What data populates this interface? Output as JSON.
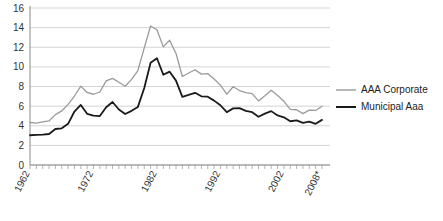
{
  "chart_data": {
    "type": "line",
    "title": "",
    "subtitle": "",
    "xlabel": "",
    "ylabel": "",
    "xlim": [
      1962,
      2008
    ],
    "ylim": [
      0,
      16
    ],
    "ytick_step": 2,
    "grid": true,
    "grid_axis": "y",
    "legend_position": "right",
    "x": [
      1962,
      1963,
      1964,
      1965,
      1966,
      1967,
      1968,
      1969,
      1970,
      1971,
      1972,
      1973,
      1974,
      1975,
      1976,
      1977,
      1978,
      1979,
      1980,
      1981,
      1982,
      1983,
      1984,
      1985,
      1986,
      1987,
      1988,
      1989,
      1990,
      1991,
      1992,
      1993,
      1994,
      1995,
      1996,
      1997,
      1998,
      1999,
      2000,
      2001,
      2002,
      2003,
      2004,
      2005,
      2006,
      2007,
      2008
    ],
    "categories": [
      "1962",
      "1963",
      "1964",
      "1965",
      "1966",
      "1967",
      "1968",
      "1969",
      "1970",
      "1971",
      "1972",
      "1973",
      "1974",
      "1975",
      "1976",
      "1977",
      "1978",
      "1979",
      "1980",
      "1981",
      "1982",
      "1983",
      "1984",
      "1985",
      "1986",
      "1987",
      "1988",
      "1989",
      "1990",
      "1991",
      "1992",
      "1993",
      "1994",
      "1995",
      "1996",
      "1997",
      "1998",
      "1999",
      "2000",
      "2001",
      "2002",
      "2003",
      "2004",
      "2005",
      "2006",
      "2007",
      "2008"
    ],
    "xtick_labels": [
      "1962",
      "1972",
      "1982",
      "1992",
      "2002",
      "2008*"
    ],
    "xtick_values": [
      1962,
      1972,
      1982,
      1992,
      2002,
      2008
    ],
    "ytick_labels": [
      "0",
      "2",
      "4",
      "6",
      "8",
      "10",
      "12",
      "14",
      "16"
    ],
    "ytick_values": [
      0,
      2,
      4,
      6,
      8,
      10,
      12,
      14,
      16
    ],
    "series": [
      {
        "name": "AAA Corporate",
        "color": "#9a9a9a",
        "width": 1.3,
        "values": [
          4.33,
          4.26,
          4.4,
          4.49,
          5.13,
          5.51,
          6.18,
          7.03,
          8.04,
          7.39,
          7.21,
          7.44,
          8.57,
          8.83,
          8.43,
          8.02,
          8.73,
          9.63,
          11.94,
          14.17,
          13.79,
          12.04,
          12.71,
          11.37,
          9.02,
          9.38,
          9.71,
          9.26,
          9.32,
          8.77,
          8.14,
          7.22,
          7.97,
          7.59,
          7.37,
          7.27,
          6.53,
          7.05,
          7.62,
          7.08,
          6.49,
          5.67,
          5.63,
          5.24,
          5.59,
          5.56,
          5.98
        ]
      },
      {
        "name": "Municipal Aaa",
        "color": "#1a1a1a",
        "width": 1.8,
        "values": [
          3.03,
          3.06,
          3.09,
          3.16,
          3.67,
          3.74,
          4.2,
          5.45,
          6.12,
          5.22,
          5.04,
          4.99,
          5.89,
          6.42,
          5.66,
          5.2,
          5.52,
          5.92,
          7.85,
          10.43,
          10.88,
          9.2,
          9.51,
          8.6,
          6.95,
          7.14,
          7.36,
          7.0,
          6.96,
          6.56,
          6.09,
          5.38,
          5.77,
          5.8,
          5.52,
          5.38,
          4.92,
          5.24,
          5.49,
          5.05,
          4.86,
          4.46,
          4.54,
          4.29,
          4.42,
          4.2,
          4.6
        ]
      }
    ]
  },
  "legend": {
    "items": [
      {
        "label": "AAA Corporate",
        "color": "#9a9a9a"
      },
      {
        "label": "Municipal Aaa",
        "color": "#1a1a1a"
      }
    ]
  },
  "axes": {
    "y_axis_name": "yield-axis",
    "x_axis_name": "year-axis"
  }
}
